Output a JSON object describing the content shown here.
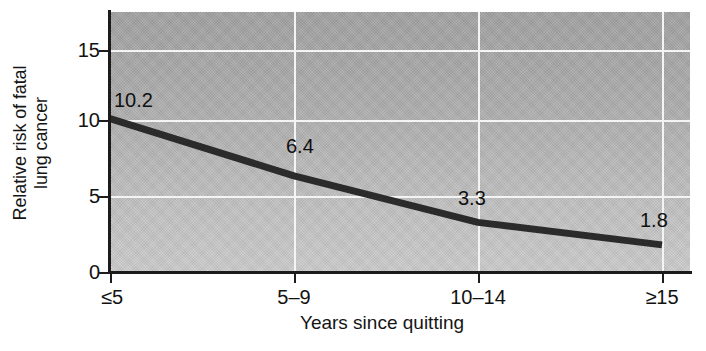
{
  "chart_data": {
    "type": "line",
    "title": "",
    "subtitle": "",
    "xlabel": "Years since quitting",
    "ylabel": "Relative risk of fatal lung cancer",
    "ylabel_lines": [
      "Relative risk of fatal",
      "lung cancer"
    ],
    "categories": [
      "≤5",
      "5–9",
      "10–14",
      "≥15"
    ],
    "values": [
      10.2,
      6.4,
      3.3,
      1.8
    ],
    "point_labels": [
      "10.2",
      "6.4",
      "3.3",
      "1.8"
    ],
    "yticks": [
      0,
      5,
      10,
      15
    ],
    "ytick_labels": [
      "0",
      "5",
      "10",
      "15"
    ],
    "ylim": [
      0,
      17.3
    ],
    "xlim": [
      0,
      3
    ],
    "grid": true,
    "grid_color": "#f4f4f4",
    "legend": null,
    "legend_position": "none",
    "series": [
      {
        "name": "Relative risk of fatal lung cancer",
        "values": [
          10.2,
          6.4,
          3.3,
          1.8
        ],
        "color": "#2b2b2b"
      }
    ],
    "plot_background": "#b4b4b4",
    "line_color": "#2b2b2b",
    "axis_color": "#1b1b1b"
  },
  "axes": {
    "y": {
      "label_line1": "Relative risk of fatal",
      "label_line2": "lung cancer",
      "ticks": [
        {
          "value": "15",
          "y": 38
        },
        {
          "value": "10",
          "y": 108
        },
        {
          "value": "5",
          "y": 184
        },
        {
          "value": "0",
          "y": 260
        }
      ]
    },
    "x": {
      "label": "Years since quitting",
      "ticks": [
        {
          "value": "≤5",
          "x": 0
        },
        {
          "value": "5–9",
          "x": 184
        },
        {
          "value": "10–14",
          "x": 368
        },
        {
          "value": "≥15",
          "x": 552
        }
      ]
    }
  },
  "annotations": [
    {
      "text": "10.2",
      "left": 4,
      "top": 78
    },
    {
      "text": "6.4",
      "left": 176,
      "top": 124
    },
    {
      "text": "3.3",
      "left": 348,
      "top": 176
    },
    {
      "text": "1.8",
      "left": 530,
      "top": 198
    }
  ]
}
